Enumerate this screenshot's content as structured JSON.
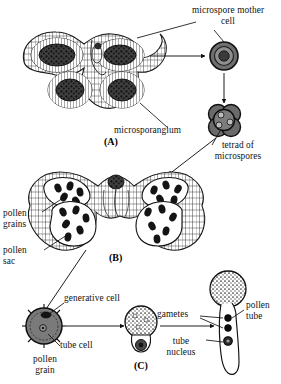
{
  "figure": {
    "background_color": "#ffffff",
    "ink_color": "#111111",
    "fill_gray_mid": "#8a8a8a",
    "fill_gray_dark": "#3a3a3a",
    "fill_gray_light": "#d8d8d8"
  },
  "labels": {
    "microspore_mother_cell": "microspore mother\ncell",
    "microsporangium": "microsporangium",
    "tetrad_of_microspores": "tetrad of\nmicrospores",
    "pollen_grains": "pollen\ngrains",
    "pollen_sac": "pollen\nsac",
    "generative_cell": "generative cell",
    "tube_cell": "tube cell",
    "pollen_grain": "pollen\ngrain",
    "gametes": "gametes",
    "tube_nucleus": "tube\nnucleus",
    "pollen_tube": "pollen\ntube"
  },
  "panels": [
    {
      "id": "A",
      "label": "(A)",
      "caption": "young anther cross-section with microsporangia"
    },
    {
      "id": "B",
      "label": "(B)",
      "caption": "mature anther cross-section with pollen sacs"
    },
    {
      "id": "C",
      "label": "(C)",
      "caption": "germinating pollen grain"
    }
  ],
  "stages": [
    {
      "name": "microspore-mother-cell",
      "shape": "concentric-circle",
      "nucleus": true
    },
    {
      "name": "tetrad-of-microspores",
      "shape": "cluster-of-four-circles",
      "count": 4
    },
    {
      "name": "pollen-grain",
      "shape": "spiky-circle",
      "contains": [
        "generative cell",
        "tube cell"
      ]
    },
    {
      "name": "germinating-pollen-grain",
      "shape": "stippled-circle-with-lobe"
    },
    {
      "name": "pollen-tube",
      "shape": "tube-with-nuclei",
      "nuclei": 3
    }
  ]
}
